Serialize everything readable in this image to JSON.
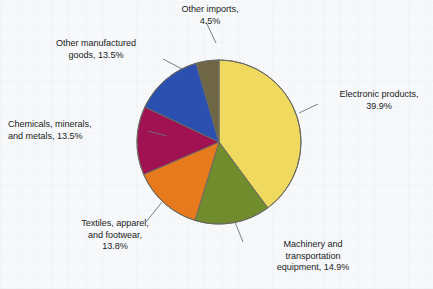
{
  "chart_data": {
    "type": "pie",
    "title": "",
    "subtitle": "",
    "xlabel": "",
    "ylabel": "",
    "legend_position": "labels-with-leader-lines",
    "grid": false,
    "units": "percent",
    "start_angle_deg": 0,
    "direction": "clockwise",
    "categories": [
      "Electronic products",
      "Machinery and transportation equipment",
      "Textiles, apparel, and footwear",
      "Chemicals, minerals, and metals",
      "Other manufactured goods",
      "Other imports"
    ],
    "values": [
      39.9,
      14.9,
      13.8,
      13.5,
      13.5,
      4.5
    ],
    "colors": [
      "#EFD95F",
      "#708C2C",
      "#E87A1E",
      "#A01252",
      "#2C50B0",
      "#6E6644"
    ],
    "slices": [
      {
        "name": "Electronic products",
        "value": 39.9,
        "color": "#EFD95F",
        "label_lines": [
          "Electronic products,",
          "39.9%"
        ],
        "label_text": "Electronic products, 39.9%"
      },
      {
        "name": "Machinery and transportation equipment",
        "value": 14.9,
        "color": "#708C2C",
        "label_lines": [
          "Machinery and",
          "transportation",
          "equipment, 14.9%"
        ],
        "label_text": "Machinery and transportation equipment, 14.9%"
      },
      {
        "name": "Textiles, apparel, and footwear",
        "value": 13.8,
        "color": "#E87A1E",
        "label_lines": [
          "Textiles, apparel,",
          "and footwear,",
          "13.8%"
        ],
        "label_text": "Textiles, apparel, and footwear, 13.8%"
      },
      {
        "name": "Chemicals, minerals, and metals",
        "value": 13.5,
        "color": "#A01252",
        "label_lines": [
          "Chemicals, minerals,",
          "and metals, 13.5%"
        ],
        "label_text": "Chemicals, minerals, and metals, 13.5%"
      },
      {
        "name": "Other manufactured goods",
        "value": 13.5,
        "color": "#2C50B0",
        "label_lines": [
          "Other manufactured",
          "goods, 13.5%"
        ],
        "label_text": "Other manufactured goods, 13.5%"
      },
      {
        "name": "Other imports",
        "value": 4.5,
        "color": "#6E6644",
        "label_lines": [
          "Other imports,",
          "4.5%"
        ],
        "label_text": "Other imports, 4.5%"
      }
    ]
  },
  "labels": {
    "electronic": "Electronic products,\n39.9%",
    "machinery": "Machinery and\ntransportation\nequipment, 14.9%",
    "textiles": "Textiles, apparel,\nand footwear,\n13.8%",
    "chemicals": "Chemicals, minerals,\nand metals, 13.5%",
    "other_manufactured": "Other manufactured\ngoods, 13.5%",
    "other_imports": "Other imports,\n4.5%"
  },
  "style": {
    "background": "#f7f8fa",
    "outline": "#6a6a62",
    "leader_line": "#6f7076",
    "text": "#1b1d22"
  }
}
